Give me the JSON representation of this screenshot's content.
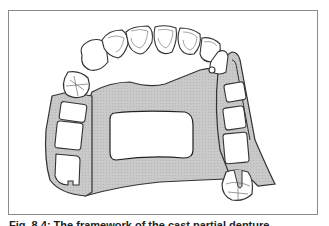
{
  "figure": {
    "caption": "Fig. 8.4: The framework of the cast partial denture",
    "colors": {
      "frame_border": "#8a8a8a",
      "metal_fill": "#c4c4c4",
      "outline": "#333333",
      "tooth_fill": "#ffffff"
    },
    "elements": [
      "anterior-teeth",
      "palatal-plate",
      "palatal-window",
      "left-posterior-saddle",
      "right-posterior-saddle",
      "left-clasp-tooth",
      "right-clasp-tooth"
    ]
  }
}
